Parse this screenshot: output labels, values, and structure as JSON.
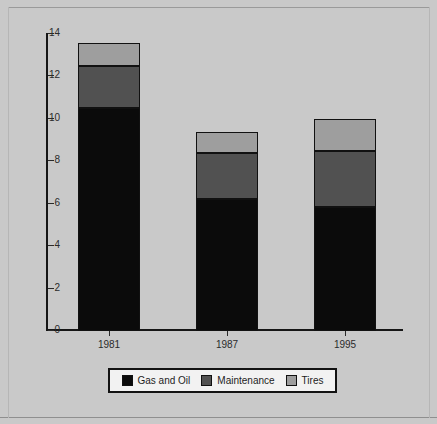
{
  "chart_data": {
    "type": "bar",
    "subtype": "stacked-bar",
    "title": "",
    "xlabel": "",
    "ylabel": "",
    "categories": [
      "1981",
      "1987",
      "1995"
    ],
    "series": [
      {
        "name": "Gas and Oil",
        "color": "#0b0b0b",
        "values": [
          10.5,
          6.2,
          5.85
        ]
      },
      {
        "name": "Maintenance",
        "color": "#515151",
        "values": [
          2.0,
          2.2,
          2.65
        ]
      },
      {
        "name": "Tires",
        "color": "#9e9e9e",
        "values": [
          1.1,
          1.0,
          1.5
        ]
      }
    ],
    "totals": [
      13.6,
      9.4,
      10.0
    ],
    "ylim": [
      0,
      14
    ],
    "yticks": [
      0,
      2,
      4,
      6,
      8,
      10,
      12,
      14
    ],
    "ytick_labels": [
      "0",
      "2",
      "4",
      "6",
      "8",
      "10",
      "12",
      "14"
    ],
    "grid": false,
    "legend_position": "bottom",
    "background_color": "#c9c9c9",
    "axis_color": "#161616"
  },
  "legend": {
    "items": [
      {
        "label": "Gas and Oil",
        "swatch": "#0b0b0b"
      },
      {
        "label": "Maintenance",
        "swatch": "#515151"
      },
      {
        "label": "Tires",
        "swatch": "#9e9e9e"
      }
    ]
  }
}
